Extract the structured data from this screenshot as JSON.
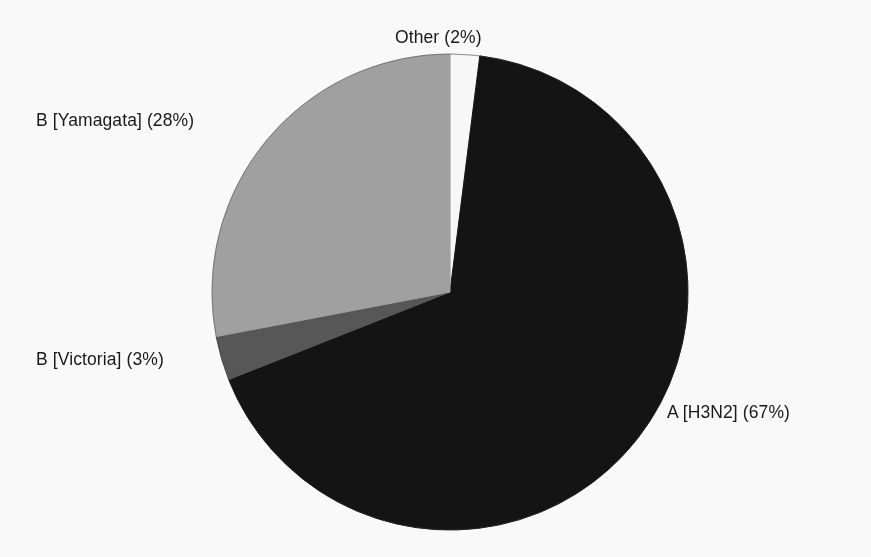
{
  "chart_data": {
    "type": "pie",
    "title": "",
    "subtitle": "",
    "xlabel": "",
    "ylabel": "",
    "legend_position": "none",
    "grid": false,
    "units": "percent",
    "categories": [
      "A [H3N2]",
      "B [Yamagata]",
      "B [Victoria]",
      "Other"
    ],
    "values": [
      67,
      28,
      3,
      2
    ],
    "labels": [
      "A [H3N2] (67%)",
      "B [Yamagata] (28%)",
      "B [Victoria] (3%)",
      "Other (2%)"
    ],
    "slices": [
      {
        "name": "A [H3N2]",
        "percent": 67,
        "percent_text": "67%",
        "label": "A [H3N2] (67%)",
        "color": "#141414",
        "start_angle_deg": 7.2,
        "end_angle_deg": 248.4
      },
      {
        "name": "B [Victoria]",
        "percent": 3,
        "percent_text": "3%",
        "label": "B [Victoria] (3%)",
        "color": "#585858",
        "start_angle_deg": 248.4,
        "end_angle_deg": 259.2
      },
      {
        "name": "B [Yamagata]",
        "percent": 28,
        "percent_text": "28%",
        "label": "B [Yamagata] (28%)",
        "color": "#a3a3a3",
        "start_angle_deg": 259.2,
        "end_angle_deg": 360.0
      },
      {
        "name": "Other",
        "percent": 2,
        "percent_text": "2%",
        "label": "Other (2%)",
        "color": "#fbfbfb",
        "start_angle_deg": 0.0,
        "end_angle_deg": 7.2
      }
    ],
    "geometry": {
      "center_x": 450,
      "center_y": 292,
      "radius": 238,
      "start_at_twelve_oclock": true,
      "direction": "clockwise"
    },
    "colors": {
      "a_h3n2": "#141414",
      "b_yamagata": "#a3a3a3",
      "b_victoria": "#585858",
      "other": "#fbfbfb",
      "outline": "#2a2a2a",
      "label_text": "#1a1a1a",
      "background": "#fdfdfd"
    }
  }
}
